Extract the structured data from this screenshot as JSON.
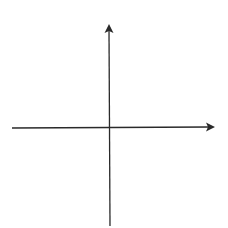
{
  "diagram": {
    "type": "cartesian-axes",
    "background": "#ffffff",
    "stroke_color": "#2a2a2a",
    "stroke_width": 1.3,
    "origin": {
      "x": 110,
      "y": 128
    },
    "x_axis": {
      "start": {
        "x": 12,
        "y": 128
      },
      "end": {
        "x": 215,
        "y": 127
      },
      "arrowhead": "right"
    },
    "y_axis": {
      "start": {
        "x": 110,
        "y": 226
      },
      "end": {
        "x": 109,
        "y": 24
      },
      "arrowhead": "up"
    },
    "labels": []
  }
}
